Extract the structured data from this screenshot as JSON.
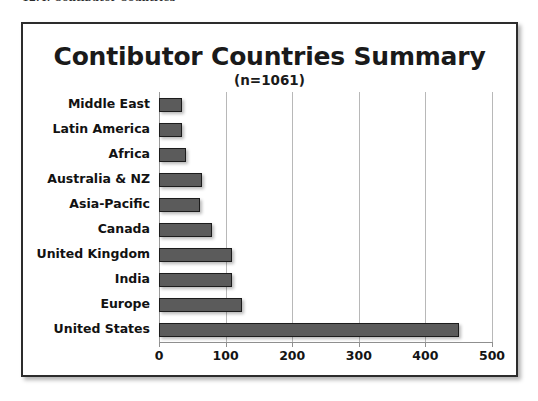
{
  "caption": {
    "text": "12.4. Contibutor Countries"
  },
  "chart_data": {
    "type": "bar",
    "orientation": "horizontal",
    "title": "Contibutor Countries Summary",
    "subtitle": "(n=1061)",
    "xlabel": "",
    "ylabel": "",
    "xlim": [
      0,
      500
    ],
    "xticks": [
      0,
      100,
      200,
      300,
      400,
      500
    ],
    "xtick_labels": [
      "0",
      "100",
      "200",
      "300",
      "400",
      "500"
    ],
    "grid": true,
    "grid_axis": "x",
    "legend": false,
    "total_n": 1061,
    "categories": [
      "Middle East",
      "Latin America",
      "Africa",
      "Australia & NZ",
      "Asia-Pacific",
      "Canada",
      "United Kingdom",
      "India",
      "Europe",
      "United States"
    ],
    "values": [
      35,
      35,
      40,
      65,
      62,
      80,
      110,
      110,
      125,
      450
    ],
    "bar_fill_color": "#5b5b5b",
    "bar_border_color": "#1c1c1c",
    "grid_color": "#b8b8b8",
    "frame_color": "#2c2c2c",
    "background_color": "#ffffff"
  }
}
